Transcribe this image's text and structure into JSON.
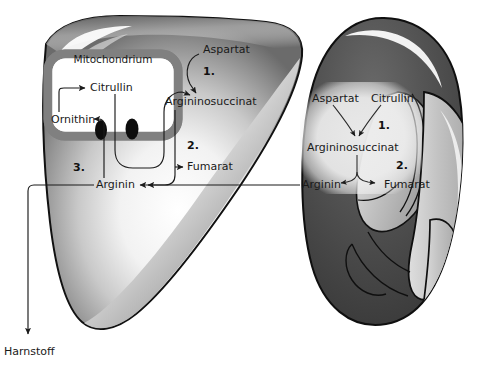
{
  "figure": {
    "background_color": "#ffffff"
  },
  "colors": {
    "liver_outline": "#111111",
    "liver_fill_light": "#ffffff",
    "liver_fill_mid": "#a8a8a8",
    "liver_fill_dark": "#6e6e6e",
    "kidney_dark": "#4a4a4a",
    "kidney_pelvis": "#b9b9b9",
    "mitochondrion_membrane": "#808080",
    "mitochondrion_matrix": "#ffffff",
    "transporter": "#0d0d0d",
    "arrow": "#1b1b1b",
    "text": "#1a1a1a",
    "text_panel": "#e8e8e8"
  },
  "liver_panel": {
    "organ_name": "liver",
    "organelle_label": "Mitochondrium",
    "metabolites": {
      "aspartat": "Aspartat",
      "citrullin": "Citrullin",
      "ornithin": "Ornithin",
      "argininosuccinat": "Argininosuccinat",
      "fumarat": "Fumarat",
      "arginin": "Arginin"
    },
    "steps": {
      "step1": "1.",
      "step2": "2.",
      "step3": "3."
    },
    "output_label": "Harnstoff"
  },
  "kidney_panel": {
    "organ_name": "kidney",
    "metabolites": {
      "aspartat": "Aspartat",
      "citrullin": "Citrullin",
      "argininosuccinat": "Argininosuccinat",
      "arginin": "Arginin",
      "fumarat": "Fumarat"
    },
    "steps": {
      "step1": "1.",
      "step2": "2."
    }
  },
  "reactions": [
    {
      "from": "Ornithin",
      "to": "Citrullin",
      "organ": "liver",
      "step": ""
    },
    {
      "from": "Citrullin",
      "to": "Argininosuccinat",
      "organ": "liver",
      "step": "1."
    },
    {
      "from": "Aspartat",
      "to": "Argininosuccinat",
      "organ": "liver",
      "step": "1."
    },
    {
      "from": "Argininosuccinat",
      "to": "Fumarat",
      "organ": "liver",
      "step": "2."
    },
    {
      "from": "Argininosuccinat",
      "to": "Arginin",
      "organ": "liver",
      "step": "2."
    },
    {
      "from": "Arginin",
      "to": "Ornithin",
      "organ": "liver",
      "step": "3."
    },
    {
      "from": "Arginin",
      "to": "Harnstoff",
      "organ": "liver",
      "step": "3."
    },
    {
      "from": "Aspartat",
      "to": "Argininosuccinat",
      "organ": "kidney",
      "step": "1."
    },
    {
      "from": "Citrullin",
      "to": "Argininosuccinat",
      "organ": "kidney",
      "step": "1."
    },
    {
      "from": "Argininosuccinat",
      "to": "Arginin",
      "organ": "kidney",
      "step": "2."
    },
    {
      "from": "Argininosuccinat",
      "to": "Fumarat",
      "organ": "kidney",
      "step": "2."
    },
    {
      "from": "kidney Arginin",
      "to": "liver Arginin",
      "organ": "transfer",
      "step": ""
    }
  ]
}
